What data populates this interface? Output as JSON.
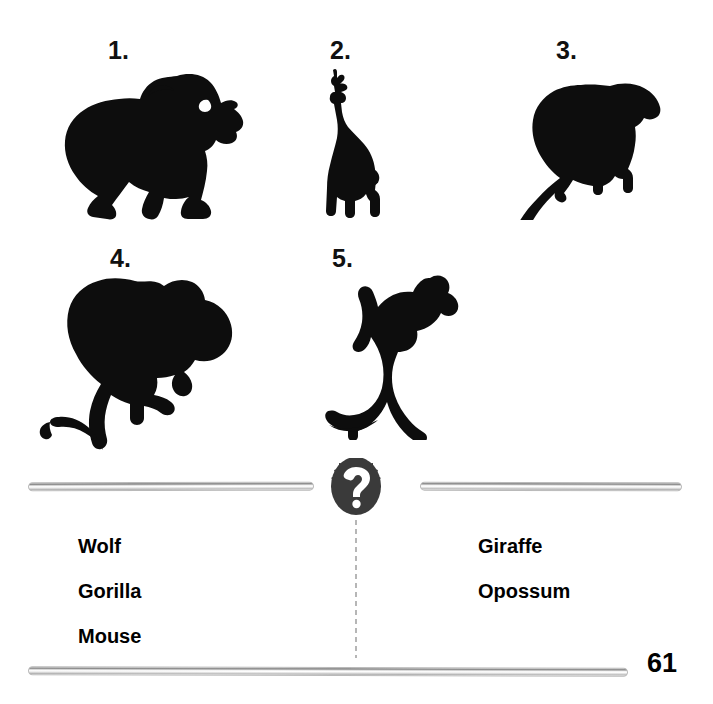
{
  "worksheet": {
    "page_number": "61",
    "badge_symbol": "?"
  },
  "items": [
    {
      "number": "1.",
      "animal": "gorilla",
      "icon": "gorilla-silhouette"
    },
    {
      "number": "2.",
      "animal": "giraffe",
      "icon": "giraffe-silhouette"
    },
    {
      "number": "3.",
      "animal": "opossum",
      "icon": "opossum-silhouette"
    },
    {
      "number": "4.",
      "animal": "mouse",
      "icon": "mouse-silhouette"
    },
    {
      "number": "5.",
      "animal": "wolf",
      "icon": "wolf-silhouette"
    }
  ],
  "word_bank": {
    "left_column": [
      "Wolf",
      "Gorilla",
      "Mouse"
    ],
    "right_column": [
      "Giraffe",
      "Opossum"
    ]
  },
  "colors": {
    "silhouette": "#0d0d0d",
    "badge": "#3a3a3a",
    "badge_text": "#ffffff",
    "bar_light": "#ffffff",
    "bar_dark": "#8d8d8d",
    "dotted_line": "#b6b6b6",
    "text": "#000000",
    "background": "#ffffff"
  }
}
